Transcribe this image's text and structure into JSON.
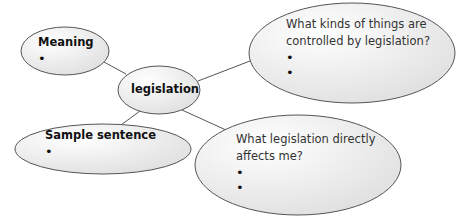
{
  "diagram": {
    "type": "mind-map",
    "colors": {
      "outline": "#555555",
      "fill_light": "#fbfbfb",
      "fill_dark": "#dcdcdc",
      "connector": "#555555"
    },
    "center": {
      "label": "legislation"
    },
    "nodes": [
      {
        "id": "meaning",
        "title": "Meaning",
        "bullets": [
          "•"
        ]
      },
      {
        "id": "controlled",
        "title": "What kinds of things are controlled by legislation?",
        "line1": "What kinds of things are",
        "line2": "controlled by legislation?",
        "bullets": [
          "•",
          "•"
        ]
      },
      {
        "id": "sample",
        "title": "Sample sentence",
        "bullets": [
          "•"
        ]
      },
      {
        "id": "affects",
        "title": "What legislation directly affects me?",
        "line1": "What legislation directly",
        "line2": "affects me?",
        "bullets": [
          "•",
          "•"
        ]
      }
    ]
  }
}
